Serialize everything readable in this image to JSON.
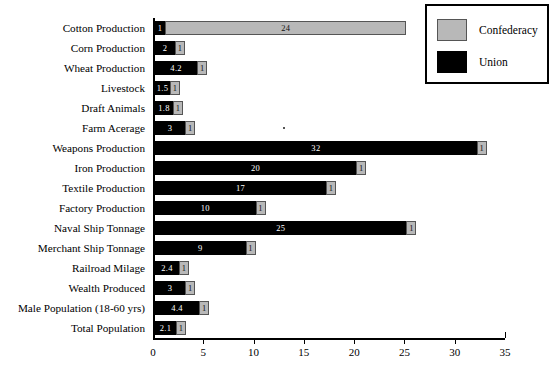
{
  "legend": {
    "entries": [
      {
        "label": "Confederacy",
        "color": "#b8b8b8",
        "icon": "legend-swatch-confederacy"
      },
      {
        "label": "Union",
        "color": "#000000",
        "icon": "legend-swatch-union"
      }
    ]
  },
  "axis": {
    "ticks": [
      "0",
      "5",
      "10",
      "15",
      "20",
      "25",
      "30",
      "35"
    ],
    "min": 0,
    "max": 35
  },
  "chart_data": {
    "type": "bar",
    "orientation": "horizontal",
    "stacked": true,
    "title": "",
    "xlabel": "",
    "ylabel": "",
    "xlim": [
      0,
      35
    ],
    "xticks": [
      0,
      5,
      10,
      15,
      20,
      25,
      30,
      35
    ],
    "grid": false,
    "legend_position": "top-right",
    "categories": [
      "Cotton Production",
      "Corn Production",
      "Wheat Production",
      "Livestock",
      "Draft Animals",
      "Farm Acerage",
      "Weapons Production",
      "Iron Production",
      "Textile Production",
      "Factory Production",
      "Naval Ship Tonnage",
      "Merchant Ship Tonnage",
      "Railroad Milage",
      "Wealth Produced",
      "Male Population (18-60 yrs)",
      "Total Population"
    ],
    "series": [
      {
        "name": "Union",
        "color": "#000000",
        "values": [
          1,
          2,
          4.2,
          1.5,
          1.8,
          3,
          32,
          20,
          17,
          10,
          25,
          9,
          2.4,
          3,
          4.4,
          2.1
        ],
        "labels": [
          "1",
          "2",
          "4.2",
          "1.5",
          "1.8",
          "3",
          "32",
          "20",
          "17",
          "10",
          "25",
          "9",
          "2.4",
          "3",
          "4.4",
          "2.1"
        ]
      },
      {
        "name": "Confederacy",
        "color": "#b8b8b8",
        "values": [
          24,
          1,
          1,
          1,
          1,
          1,
          1,
          1,
          1,
          1,
          1,
          1,
          1,
          1,
          1,
          1
        ],
        "labels": [
          "24",
          "1",
          "1",
          "1",
          "1",
          "1",
          "1",
          "1",
          "1",
          "1",
          "1",
          "1",
          "1",
          "1",
          "1",
          "1"
        ]
      }
    ]
  }
}
